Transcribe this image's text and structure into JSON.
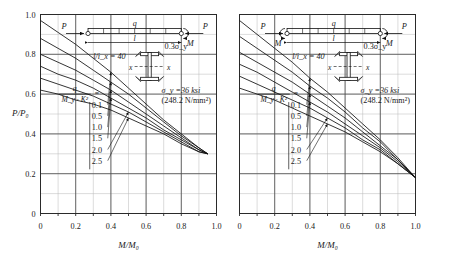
{
  "figure": {
    "caption": "",
    "panels": [
      {
        "id": "left",
        "xlabel": "M/M₀",
        "ylabel": "P/P₀",
        "loadcase": "single-curvature: end moment M at right support only",
        "beam": {
          "axial_left": "P",
          "axial_right": "P",
          "distributed": "q",
          "span": "l",
          "moment_left": "",
          "moment_right": "M"
        },
        "notes": {
          "slenderness": "l/i_x = 40",
          "residual": "0.3σ_y",
          "yield_ksi": "σ_y =36 ksi",
          "yield_si": "(248.2 N/mm²)",
          "section_axis": "x"
        },
        "legend_title_num": "q",
        "legend_title_den": "M_y · K²",
        "legend_eq": "="
      },
      {
        "id": "right",
        "xlabel": "M/M₀",
        "ylabel": "",
        "loadcase": "double-curvature: end moments M at both supports",
        "beam": {
          "axial_left": "P",
          "axial_right": "P",
          "distributed": "q",
          "span": "l",
          "moment_left": "M",
          "moment_right": "M"
        },
        "notes": {
          "slenderness": "l/i_x = 40",
          "residual": "0.3σ_y",
          "yield_ksi": "σ_y =36 ksi",
          "yield_si": "(248.2 N/mm²)",
          "section_axis": "x"
        },
        "legend_title_num": "q",
        "legend_title_den": "M_y · K²",
        "legend_eq": "="
      }
    ]
  },
  "chart_data": {
    "type": "line",
    "title": "",
    "xlabel": "M/M₀",
    "ylabel": "P/P₀",
    "xlim": [
      0,
      1.0
    ],
    "ylim": [
      0,
      1.0
    ],
    "xticks": [
      0,
      0.2,
      0.4,
      0.6,
      0.8,
      1.0
    ],
    "xticklabels": [
      "0",
      "0.2",
      "0.4",
      "0.6",
      "0.8",
      "1.0"
    ],
    "yticks": [
      0,
      0.2,
      0.4,
      0.6,
      0.8,
      1.0
    ],
    "yticklabels": [
      "0",
      "0.2",
      "0.4",
      "0.6",
      "0.8",
      "1.0"
    ],
    "grid": true,
    "grid_minor_divisions": 10,
    "legend_position": "lower-left-inside",
    "legend_title": "q / (M_y · K²) =",
    "legend_labels": [
      "0.1",
      "0.5",
      "1.0",
      "1.5",
      "2.0",
      "2.5"
    ],
    "panels": [
      {
        "name": "left",
        "subtitle": "l/i_x = 40",
        "converge_point": [
          0.95,
          0.3
        ],
        "series": [
          {
            "name": "0.1",
            "x": [
              0.0,
              0.1,
              0.2,
              0.3,
              0.4,
              0.5,
              0.6,
              0.7,
              0.8,
              0.9,
              0.95
            ],
            "y": [
              0.97,
              0.91,
              0.85,
              0.78,
              0.71,
              0.63,
              0.55,
              0.47,
              0.4,
              0.33,
              0.3
            ]
          },
          {
            "name": "0.5",
            "x": [
              0.0,
              0.1,
              0.2,
              0.3,
              0.4,
              0.5,
              0.6,
              0.7,
              0.8,
              0.9,
              0.95
            ],
            "y": [
              0.88,
              0.83,
              0.78,
              0.72,
              0.66,
              0.6,
              0.53,
              0.46,
              0.39,
              0.33,
              0.3
            ]
          },
          {
            "name": "1.0",
            "x": [
              0.0,
              0.1,
              0.2,
              0.3,
              0.4,
              0.5,
              0.6,
              0.7,
              0.8,
              0.9,
              0.95
            ],
            "y": [
              0.8,
              0.76,
              0.72,
              0.67,
              0.62,
              0.56,
              0.5,
              0.44,
              0.38,
              0.32,
              0.3
            ]
          },
          {
            "name": "1.5",
            "x": [
              0.0,
              0.1,
              0.2,
              0.3,
              0.4,
              0.5,
              0.6,
              0.7,
              0.8,
              0.9,
              0.95
            ],
            "y": [
              0.74,
              0.7,
              0.67,
              0.63,
              0.58,
              0.53,
              0.48,
              0.42,
              0.37,
              0.32,
              0.3
            ]
          },
          {
            "name": "2.0",
            "x": [
              0.0,
              0.1,
              0.2,
              0.3,
              0.4,
              0.5,
              0.6,
              0.7,
              0.8,
              0.9,
              0.95
            ],
            "y": [
              0.68,
              0.65,
              0.62,
              0.59,
              0.55,
              0.51,
              0.46,
              0.41,
              0.36,
              0.31,
              0.3
            ]
          },
          {
            "name": "2.5",
            "x": [
              0.0,
              0.1,
              0.2,
              0.3,
              0.4,
              0.5,
              0.6,
              0.7,
              0.8,
              0.9,
              0.95
            ],
            "y": [
              0.62,
              0.6,
              0.57,
              0.55,
              0.52,
              0.48,
              0.44,
              0.4,
              0.35,
              0.31,
              0.3
            ]
          }
        ]
      },
      {
        "name": "right",
        "subtitle": "l/i_x = 40",
        "converge_point": [
          1.0,
          0.18
        ],
        "series": [
          {
            "name": "0.1",
            "x": [
              0.0,
              0.1,
              0.2,
              0.3,
              0.4,
              0.5,
              0.6,
              0.7,
              0.8,
              0.9,
              1.0
            ],
            "y": [
              0.97,
              0.9,
              0.83,
              0.76,
              0.68,
              0.61,
              0.53,
              0.45,
              0.37,
              0.28,
              0.18
            ]
          },
          {
            "name": "0.5",
            "x": [
              0.0,
              0.1,
              0.2,
              0.3,
              0.4,
              0.5,
              0.6,
              0.7,
              0.8,
              0.9,
              1.0
            ],
            "y": [
              0.89,
              0.83,
              0.77,
              0.71,
              0.64,
              0.58,
              0.51,
              0.43,
              0.36,
              0.27,
              0.18
            ]
          },
          {
            "name": "1.0",
            "x": [
              0.0,
              0.1,
              0.2,
              0.3,
              0.4,
              0.5,
              0.6,
              0.7,
              0.8,
              0.9,
              1.0
            ],
            "y": [
              0.81,
              0.76,
              0.71,
              0.66,
              0.6,
              0.54,
              0.48,
              0.41,
              0.34,
              0.27,
              0.18
            ]
          },
          {
            "name": "1.5",
            "x": [
              0.0,
              0.1,
              0.2,
              0.3,
              0.4,
              0.5,
              0.6,
              0.7,
              0.8,
              0.9,
              1.0
            ],
            "y": [
              0.75,
              0.71,
              0.66,
              0.61,
              0.56,
              0.51,
              0.45,
              0.39,
              0.33,
              0.26,
              0.18
            ]
          },
          {
            "name": "2.0",
            "x": [
              0.0,
              0.1,
              0.2,
              0.3,
              0.4,
              0.5,
              0.6,
              0.7,
              0.8,
              0.9,
              1.0
            ],
            "y": [
              0.69,
              0.65,
              0.61,
              0.57,
              0.53,
              0.48,
              0.43,
              0.37,
              0.32,
              0.25,
              0.18
            ]
          },
          {
            "name": "2.5",
            "x": [
              0.0,
              0.1,
              0.2,
              0.3,
              0.4,
              0.5,
              0.6,
              0.7,
              0.8,
              0.9,
              1.0
            ],
            "y": [
              0.63,
              0.6,
              0.57,
              0.53,
              0.49,
              0.45,
              0.41,
              0.36,
              0.31,
              0.25,
              0.18
            ]
          }
        ]
      }
    ]
  }
}
